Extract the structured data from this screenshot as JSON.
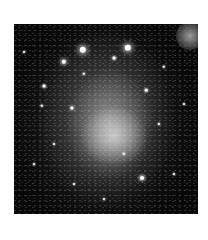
{
  "image": {
    "subject": "galaxy",
    "palette": {
      "background": "#ffffff",
      "sky": "#080808",
      "glow": "#e1e1e1",
      "star": "#ffffff"
    },
    "frame": {
      "left": 14,
      "top": 24,
      "width": 184,
      "height": 190
    },
    "bright_stars": [
      {
        "x": 69,
        "y": 26,
        "r": 3.2
      },
      {
        "x": 114,
        "y": 24,
        "r": 3.2
      },
      {
        "x": 50,
        "y": 38,
        "r": 2.2
      },
      {
        "x": 30,
        "y": 62,
        "r": 1.4
      },
      {
        "x": 58,
        "y": 84,
        "r": 1.6
      },
      {
        "x": 28,
        "y": 82,
        "r": 1.2
      },
      {
        "x": 132,
        "y": 66,
        "r": 1.3
      },
      {
        "x": 150,
        "y": 43,
        "r": 1.2
      },
      {
        "x": 128,
        "y": 154,
        "r": 2.0
      },
      {
        "x": 70,
        "y": 50,
        "r": 1.2
      },
      {
        "x": 100,
        "y": 34,
        "r": 1.4
      },
      {
        "x": 20,
        "y": 140,
        "r": 1.0
      },
      {
        "x": 160,
        "y": 150,
        "r": 1.0
      },
      {
        "x": 40,
        "y": 120,
        "r": 1.0
      },
      {
        "x": 90,
        "y": 175,
        "r": 1.0
      },
      {
        "x": 145,
        "y": 100,
        "r": 1.1
      },
      {
        "x": 10,
        "y": 28,
        "r": 1.0
      },
      {
        "x": 170,
        "y": 80,
        "r": 1.0
      },
      {
        "x": 60,
        "y": 160,
        "r": 1.0
      },
      {
        "x": 110,
        "y": 130,
        "r": 1.2
      }
    ],
    "blobs": [
      {
        "x": 176,
        "y": 12,
        "r": 14
      }
    ]
  }
}
